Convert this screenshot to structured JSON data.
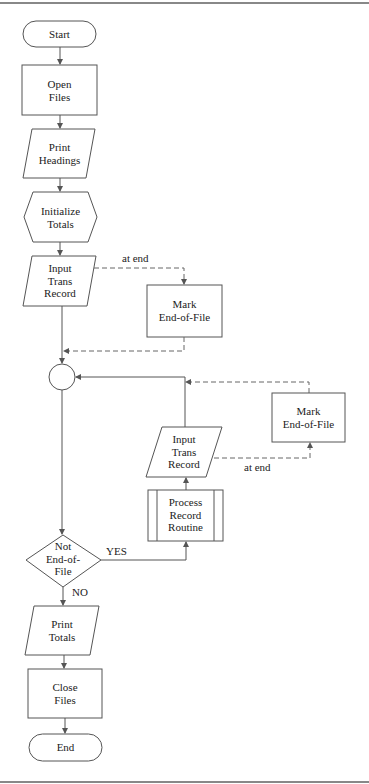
{
  "diagram": {
    "type": "flowchart",
    "nodes": [
      {
        "id": "start",
        "shape": "terminal",
        "label": "Start"
      },
      {
        "id": "open",
        "shape": "process",
        "label_lines": [
          "Open",
          "Files"
        ]
      },
      {
        "id": "headings",
        "shape": "io",
        "label_lines": [
          "Print",
          "Headings"
        ]
      },
      {
        "id": "init",
        "shape": "preparation",
        "label_lines": [
          "Initialize",
          "Totals"
        ]
      },
      {
        "id": "input1",
        "shape": "io",
        "label_lines": [
          "Input",
          "Trans",
          "Record"
        ]
      },
      {
        "id": "eof1",
        "shape": "process",
        "label_lines": [
          "Mark",
          "End-of-File"
        ]
      },
      {
        "id": "connector",
        "shape": "connector",
        "label": ""
      },
      {
        "id": "decision",
        "shape": "decision",
        "label_lines": [
          "Not",
          "End-of-",
          "File"
        ]
      },
      {
        "id": "routine",
        "shape": "predefined-process",
        "label_lines": [
          "Process",
          "Record",
          "Routine"
        ]
      },
      {
        "id": "input2",
        "shape": "io",
        "label_lines": [
          "Input",
          "Trans",
          "Record"
        ]
      },
      {
        "id": "eof2",
        "shape": "process",
        "label_lines": [
          "Mark",
          "End-of-File"
        ]
      },
      {
        "id": "totals",
        "shape": "io",
        "label_lines": [
          "Print",
          "Totals"
        ]
      },
      {
        "id": "close",
        "shape": "process",
        "label_lines": [
          "Close",
          "Files"
        ]
      },
      {
        "id": "end",
        "shape": "terminal",
        "label": "End"
      }
    ],
    "edges": [
      {
        "from": "start",
        "to": "open"
      },
      {
        "from": "open",
        "to": "headings"
      },
      {
        "from": "headings",
        "to": "init"
      },
      {
        "from": "init",
        "to": "input1"
      },
      {
        "from": "input1",
        "to": "eof1",
        "label": "at end",
        "style": "dashed"
      },
      {
        "from": "eof1",
        "to": "connector",
        "style": "dashed"
      },
      {
        "from": "input1",
        "to": "connector"
      },
      {
        "from": "connector",
        "to": "decision"
      },
      {
        "from": "decision",
        "to": "routine",
        "label": "YES"
      },
      {
        "from": "routine",
        "to": "input2"
      },
      {
        "from": "input2",
        "to": "eof2",
        "label": "at end",
        "style": "dashed"
      },
      {
        "from": "eof2",
        "to": "connector",
        "style": "dashed"
      },
      {
        "from": "input2",
        "to": "connector"
      },
      {
        "from": "decision",
        "to": "totals",
        "label": "NO"
      },
      {
        "from": "totals",
        "to": "close"
      },
      {
        "from": "close",
        "to": "end"
      }
    ]
  },
  "labels": {
    "start": "Start",
    "open_1": "Open",
    "open_2": "Files",
    "headings_1": "Print",
    "headings_2": "Headings",
    "init_1": "Initialize",
    "init_2": "Totals",
    "input1_1": "Input",
    "input1_2": "Trans",
    "input1_3": "Record",
    "eof1_1": "Mark",
    "eof1_2": "End-of-File",
    "decision_1": "Not",
    "decision_2": "End-of-",
    "decision_3": "File",
    "routine_1": "Process",
    "routine_2": "Record",
    "routine_3": "Routine",
    "input2_1": "Input",
    "input2_2": "Trans",
    "input2_3": "Record",
    "eof2_1": "Mark",
    "eof2_2": "End-of-File",
    "totals_1": "Print",
    "totals_2": "Totals",
    "close_1": "Close",
    "close_2": "Files",
    "end": "End"
  },
  "edge_labels": {
    "at_end_1": "at end",
    "at_end_2": "at end",
    "yes": "YES",
    "no": "NO"
  }
}
